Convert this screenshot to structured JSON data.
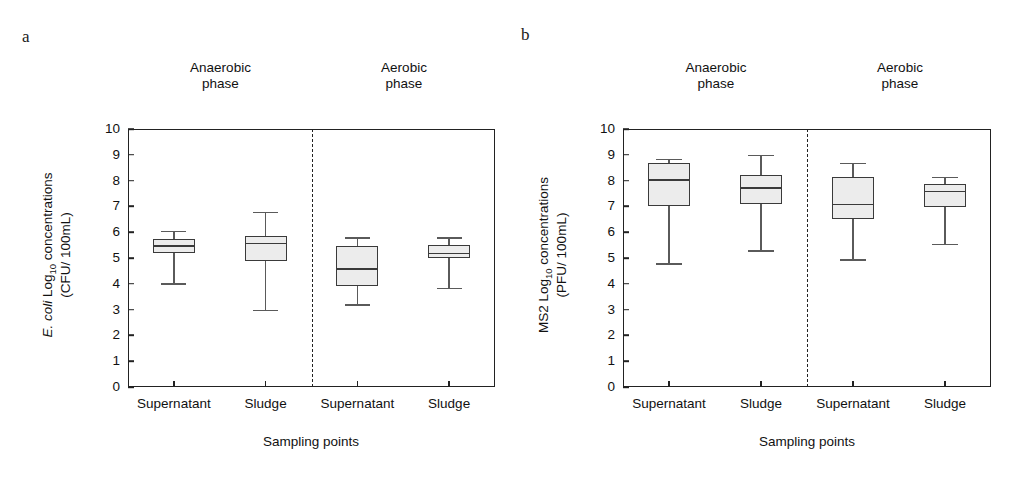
{
  "figure": {
    "panels": [
      {
        "label": "a",
        "ylabel_line1_prefix": "E. coli",
        "ylabel_line1_rest": " Log",
        "ylabel_sub": "10",
        "ylabel_line1_tail": " concentrations",
        "ylabel_line2": "(CFU/ 100mL)",
        "xtitle": "Sampling points",
        "groups": [
          "Anaerobic\nphase",
          "Aerobic\nphase"
        ],
        "categories": [
          "Supernatant",
          "Sludge",
          "Supernatant",
          "Sludge"
        ],
        "yticks": [
          "0",
          "1",
          "2",
          "3",
          "4",
          "5",
          "6",
          "7",
          "8",
          "9",
          "10"
        ]
      },
      {
        "label": "b",
        "ylabel_line1_prefix": "MS2",
        "ylabel_line1_rest": " Log",
        "ylabel_sub": "10",
        "ylabel_line1_tail": " concentrations",
        "ylabel_line2": "(PFU/ 100mL)",
        "xtitle": "Sampling points",
        "groups": [
          "Anaerobic\nphase",
          "Aerobic\nphase"
        ],
        "categories": [
          "Supernatant",
          "Sludge",
          "Supernatant",
          "Sludge"
        ],
        "yticks": [
          "0",
          "1",
          "2",
          "3",
          "4",
          "5",
          "6",
          "7",
          "8",
          "9",
          "10"
        ]
      }
    ]
  },
  "chart_data": [
    {
      "type": "box",
      "panel": "a",
      "title": "E. coli Log10 concentrations (CFU/ 100mL)",
      "xlabel": "Sampling points",
      "ylabel": "E. coli Log10 concentrations (CFU/ 100mL)",
      "ylim": [
        0,
        10
      ],
      "ytick_step": 1,
      "grid": false,
      "legend": "none",
      "groups": [
        "Anaerobic phase",
        "Aerobic phase"
      ],
      "categories": [
        "Supernatant",
        "Sludge",
        "Supernatant",
        "Sludge"
      ],
      "boxes": [
        {
          "group": "Anaerobic phase",
          "category": "Supernatant",
          "whisker_low": 4.02,
          "q1": 5.2,
          "median": 5.5,
          "q3": 5.73,
          "whisker_high": 6.05
        },
        {
          "group": "Anaerobic phase",
          "category": "Sludge",
          "whisker_low": 3.0,
          "q1": 4.9,
          "median": 5.6,
          "q3": 5.85,
          "whisker_high": 6.8
        },
        {
          "group": "Aerobic phase",
          "category": "Supernatant",
          "whisker_low": 3.2,
          "q1": 3.92,
          "median": 4.6,
          "q3": 5.45,
          "whisker_high": 5.8
        },
        {
          "group": "Aerobic phase",
          "category": "Sludge",
          "whisker_low": 3.85,
          "q1": 5.0,
          "median": 5.2,
          "q3": 5.5,
          "whisker_high": 5.8
        }
      ]
    },
    {
      "type": "box",
      "panel": "b",
      "title": "MS2 Log10 concentrations (PFU/ 100mL)",
      "xlabel": "Sampling points",
      "ylabel": "MS2 Log10 concentrations (PFU/ 100mL)",
      "ylim": [
        0,
        10
      ],
      "ytick_step": 1,
      "grid": false,
      "legend": "none",
      "groups": [
        "Anaerobic phase",
        "Aerobic phase"
      ],
      "categories": [
        "Supernatant",
        "Sludge",
        "Supernatant",
        "Sludge"
      ],
      "boxes": [
        {
          "group": "Anaerobic phase",
          "category": "Supernatant",
          "whisker_low": 4.8,
          "q1": 7.0,
          "median": 8.05,
          "q3": 8.7,
          "whisker_high": 8.85
        },
        {
          "group": "Anaerobic phase",
          "category": "Sludge",
          "whisker_low": 5.3,
          "q1": 7.1,
          "median": 7.75,
          "q3": 8.22,
          "whisker_high": 9.0
        },
        {
          "group": "Aerobic phase",
          "category": "Supernatant",
          "whisker_low": 4.95,
          "q1": 6.5,
          "median": 7.1,
          "q3": 8.15,
          "whisker_high": 8.7
        },
        {
          "group": "Aerobic phase",
          "category": "Sludge",
          "whisker_low": 5.55,
          "q1": 6.98,
          "median": 7.6,
          "q3": 7.88,
          "whisker_high": 8.15
        }
      ]
    }
  ],
  "style": {
    "box_fill": "#ececec",
    "box_stroke": "#3a3a3a",
    "axis_color": "#222222",
    "text_color": "#111111"
  }
}
